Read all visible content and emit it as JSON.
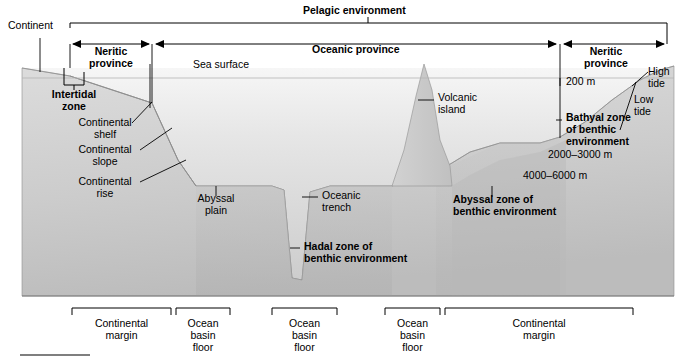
{
  "figure": {
    "colors": {
      "land": "#c9c9c9",
      "water_top": "#f2f2f2",
      "water_bottom": "#d0d0d0",
      "seafloor": "#bdbdbd",
      "line": "#000000",
      "text": "#000000"
    }
  },
  "top_labels": {
    "pelagic_environment": "Pelagic environment",
    "continent": "Continent",
    "neritic_province_left": "Neritic\nprovince",
    "oceanic_province": "Oceanic province",
    "neritic_province_right": "Neritic\nprovince",
    "sea_surface": "Sea surface"
  },
  "feature_labels": {
    "intertidal_zone": "Intertidal\nzone",
    "continental_shelf": "Continental\nshelf",
    "continental_slope": "Continental\nslope",
    "continental_rise": "Continental\nrise",
    "abyssal_plain": "Abyssal\nplain",
    "oceanic_trench": "Oceanic\ntrench",
    "hadal_zone": "Hadal zone of\nbenthic environment",
    "volcanic_island": "Volcanic\nisland",
    "abyssal_zone": "Abyssal zone of\nbenthic environment",
    "bathyal_zone": "Bathyal zone\nof benthic\nenvironment",
    "high_tide": "High\ntide",
    "low_tide": "Low\ntide"
  },
  "depths": {
    "shelf_break": "200 m",
    "bathyal_range": "2000–3000 m",
    "abyssal_range": "4000–6000 m"
  },
  "bottom_brackets": [
    {
      "label": "Continental\nmargin",
      "x0": 72,
      "x1": 171
    },
    {
      "label": "Ocean\nbasin\nfloor",
      "x0": 176,
      "x1": 230
    },
    {
      "label": "Ocean\nbasin\nfloor",
      "x0": 272,
      "x1": 337
    },
    {
      "label": "Ocean\nbasin\nfloor",
      "x0": 385,
      "x1": 440
    },
    {
      "label": "Continental\nmargin",
      "x0": 445,
      "x1": 633
    }
  ]
}
